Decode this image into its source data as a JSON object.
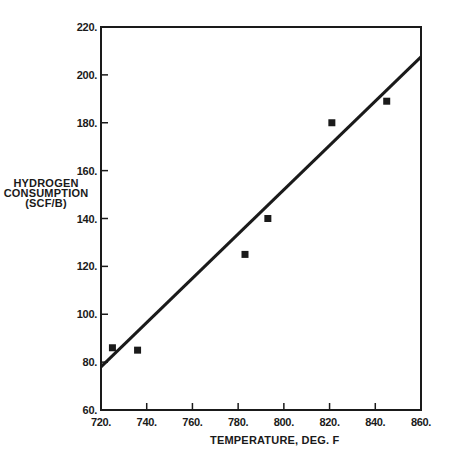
{
  "chart_data": {
    "type": "scatter",
    "title": "",
    "xlabel": "TEMPERATURE, DEG. F",
    "ylabel_lines": [
      "HYDROGEN",
      "CONSUMPTION",
      "(SCF/B)"
    ],
    "ylabel": "HYDROGEN CONSUMPTION (SCF/B)",
    "xlim": [
      720,
      860
    ],
    "ylim": [
      60,
      220
    ],
    "x_ticks": [
      720,
      740,
      760,
      780,
      800,
      820,
      840,
      860
    ],
    "y_ticks": [
      60,
      80,
      100,
      120,
      140,
      160,
      180,
      200,
      220
    ],
    "x_tick_labels": [
      "720.",
      "740.",
      "760.",
      "780.",
      "800.",
      "820.",
      "840.",
      "860."
    ],
    "y_tick_labels": [
      "60.",
      "80.",
      "100.",
      "120.",
      "140.",
      "160.",
      "180.",
      "200.",
      "220."
    ],
    "grid": false,
    "legend": null,
    "series": [
      {
        "name": "Observed data",
        "type": "scatter",
        "marker": "square",
        "color": "#1a1a1a",
        "points": [
          {
            "x": 725,
            "y": 86
          },
          {
            "x": 736,
            "y": 85
          },
          {
            "x": 783,
            "y": 125
          },
          {
            "x": 793,
            "y": 140
          },
          {
            "x": 821,
            "y": 180
          },
          {
            "x": 845,
            "y": 189
          }
        ]
      },
      {
        "name": "Linear fit",
        "type": "line",
        "color": "#1a1a1a",
        "points": [
          {
            "x": 720,
            "y": 78
          },
          {
            "x": 860,
            "y": 207.5
          }
        ]
      }
    ]
  },
  "colors": {
    "ink": "#1a1a1a",
    "background": "#ffffff"
  }
}
